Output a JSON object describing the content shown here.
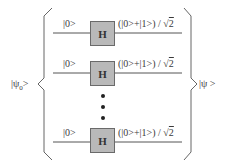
{
  "diagram": {
    "input_state": "|ψ",
    "input_subscript": "0",
    "input_close": ">",
    "output_state": "|ψ >",
    "qubits": [
      {
        "input": "|0>",
        "gate": "H",
        "output_prefix": "(|0>+|1>) / √",
        "output_radicand": "2"
      },
      {
        "input": "|0>",
        "gate": "H",
        "output_prefix": "(|0>+|1>) / √",
        "output_radicand": "2"
      },
      {
        "input": "|0>",
        "gate": "H",
        "output_prefix": "(|0>+|1>) / √",
        "output_radicand": "2"
      }
    ],
    "ellipsis": "vertical-dots",
    "colors": {
      "gate_fill": "#b9b9b9",
      "gate_border": "#6a6a6a",
      "wire": "#555555",
      "brace": "#666666"
    }
  }
}
